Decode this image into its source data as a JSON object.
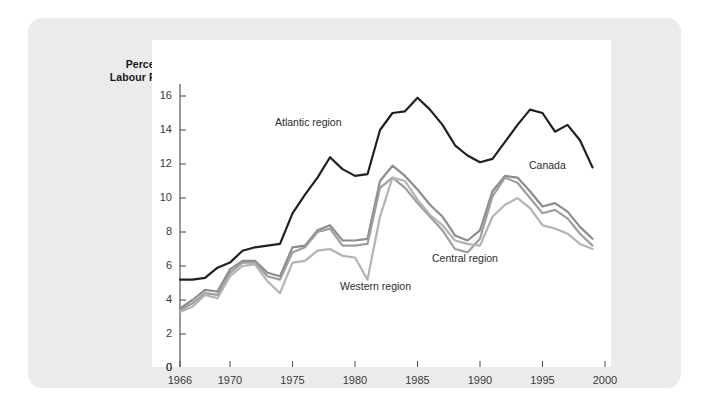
{
  "chart_data": {
    "type": "line",
    "title": "",
    "subtitle": "",
    "xlabel": "",
    "ylabel": "Percent of Labour Force",
    "ylabel_line1": "Percent of",
    "ylabel_line2": "Labour Force",
    "xlim": [
      1966,
      2000
    ],
    "ylim": [
      0,
      16
    ],
    "ytick_labels": [
      "0",
      "2",
      "4",
      "6",
      "8",
      "10",
      "12",
      "14",
      "16"
    ],
    "yticks": [
      0,
      2,
      4,
      6,
      8,
      10,
      12,
      14,
      16
    ],
    "xtick_labels": [
      "1966",
      "1970",
      "1975",
      "1980",
      "1985",
      "1990",
      "1995",
      "2000"
    ],
    "xticks": [
      1966,
      1970,
      1975,
      1980,
      1985,
      1990,
      1995,
      2000
    ],
    "grid": false,
    "legend_position": "inline-annotations",
    "x": [
      1966,
      1967,
      1968,
      1969,
      1970,
      1971,
      1972,
      1973,
      1974,
      1975,
      1976,
      1977,
      1978,
      1979,
      1980,
      1981,
      1982,
      1983,
      1984,
      1985,
      1986,
      1987,
      1988,
      1989,
      1990,
      1991,
      1992,
      1993,
      1994,
      1995,
      1996,
      1997,
      1998,
      1999
    ],
    "series": [
      {
        "name": "Atlantic region",
        "color": "#231f20",
        "width": 2.2,
        "values": [
          5.2,
          5.2,
          5.3,
          5.9,
          6.2,
          6.9,
          7.1,
          7.2,
          7.3,
          9.1,
          10.2,
          11.2,
          12.4,
          11.7,
          11.3,
          11.4,
          14.0,
          15.0,
          15.1,
          15.9,
          15.2,
          14.3,
          13.1,
          12.5,
          12.1,
          12.3,
          13.3,
          14.3,
          15.2,
          15.0,
          13.9,
          14.3,
          13.4,
          11.8
        ],
        "last_value": 11.8
      },
      {
        "name": "Canada",
        "color": "#8c8c8c",
        "width": 2.2,
        "values": [
          3.5,
          4.0,
          4.6,
          4.5,
          5.8,
          6.3,
          6.3,
          5.6,
          5.4,
          7.1,
          7.2,
          8.1,
          8.4,
          7.5,
          7.5,
          7.6,
          11.0,
          11.9,
          11.3,
          10.5,
          9.6,
          8.9,
          7.8,
          7.5,
          8.1,
          10.4,
          11.3,
          11.2,
          10.4,
          9.5,
          9.7,
          9.2,
          8.3,
          7.6
        ],
        "last_value": 7.6
      },
      {
        "name": "Central region",
        "color": "#9e9e9e",
        "width": 2.2,
        "values": [
          3.4,
          3.8,
          4.4,
          4.3,
          5.6,
          6.2,
          6.2,
          5.4,
          5.2,
          6.8,
          7.1,
          8.0,
          8.2,
          7.2,
          7.2,
          7.3,
          10.6,
          11.2,
          10.6,
          9.7,
          8.9,
          8.1,
          7.0,
          6.8,
          7.6,
          10.1,
          11.2,
          10.9,
          10.0,
          9.1,
          9.3,
          8.8,
          7.9,
          7.2
        ],
        "last_value": 7.2
      },
      {
        "name": "Western region",
        "color": "#b3b3b3",
        "width": 2.2,
        "values": [
          3.3,
          3.6,
          4.3,
          4.1,
          5.4,
          6.0,
          6.1,
          5.1,
          4.4,
          6.2,
          6.3,
          6.9,
          7.0,
          6.6,
          6.5,
          5.2,
          8.9,
          11.2,
          11.0,
          9.9,
          9.0,
          8.4,
          7.5,
          7.3,
          7.2,
          8.9,
          9.6,
          10.0,
          9.4,
          8.4,
          8.2,
          7.9,
          7.3,
          7.0
        ],
        "last_value": 7.0
      }
    ],
    "annotations": [
      {
        "text": "Atlantic region",
        "series": "Atlantic region"
      },
      {
        "text": "Canada",
        "series": "Canada"
      },
      {
        "text": "Central region",
        "series": "Central region"
      },
      {
        "text": "Western region",
        "series": "Western region"
      }
    ]
  },
  "colors": {
    "card_background": "#ebebeb",
    "plot_background": "#ffffff",
    "axis": "#555555",
    "text": "#3a3a3a"
  }
}
